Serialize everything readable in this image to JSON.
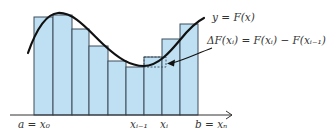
{
  "colors": {
    "bar_fill": "#bfe0f2",
    "bar_stroke": "#3d4d5c",
    "curve": "#111111",
    "axis": "#333333",
    "background": "#ffffff"
  },
  "axis": {
    "x_start": 10,
    "x_end": 232,
    "y": 115
  },
  "bars": [
    {
      "x0": 34,
      "x1": 53,
      "top": 17
    },
    {
      "x0": 53,
      "x1": 72,
      "top": 15
    },
    {
      "x0": 72,
      "x1": 89,
      "top": 29
    },
    {
      "x0": 89,
      "x1": 108,
      "top": 46
    },
    {
      "x0": 108,
      "x1": 126,
      "top": 61
    },
    {
      "x0": 126,
      "x1": 144,
      "top": 67
    },
    {
      "x0": 144,
      "x1": 162,
      "top": 57
    },
    {
      "x0": 162,
      "x1": 180,
      "top": 39
    },
    {
      "x0": 180,
      "x1": 198,
      "top": 24
    }
  ],
  "curve_path": "M28,53 C36,30 46,14 58,13 C74,12 88,30 104,45 C118,58 130,66 144,66 C158,66 170,52 180,40 C188,30 196,22 204,18",
  "highlight_box": {
    "x0": 144,
    "x1": 166,
    "top": 57,
    "bottom": 67
  },
  "pointer_arrow": "M212,48 C196,54 184,60 172,63",
  "labels": {
    "curve": {
      "text": "y = F(x)",
      "x": 212,
      "y": 12
    },
    "delta": {
      "text": "ΔF(xᵢ) = F(xᵢ) − F(xᵢ₋₁)",
      "x": 207,
      "y": 35
    },
    "a": {
      "text": "a = x₀",
      "x": 18,
      "y": 119
    },
    "xi_minus_1": {
      "text": "xᵢ₋₁",
      "x": 130,
      "y": 119
    },
    "xi": {
      "text": "xᵢ",
      "x": 160,
      "y": 119
    },
    "b": {
      "text": "b = xₙ",
      "x": 195,
      "y": 119
    }
  }
}
